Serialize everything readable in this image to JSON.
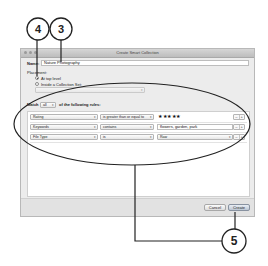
{
  "window": {
    "title": "Create Smart Collection"
  },
  "form": {
    "name_label": "Name:",
    "name_value": "Nature Photography",
    "placement_label": "Placement:",
    "radio_top_level": "At top level",
    "radio_top_level_checked": true,
    "radio_collection_set": "Inside a Collection Set:",
    "collection_set_value": ""
  },
  "rules": {
    "match_prefix": "Match",
    "match_value": "all",
    "match_suffix": "of the following rules:",
    "rows": [
      {
        "field": "Rating",
        "operator": "is greater than or equal to",
        "value": "★★★★★",
        "value_type": "stars"
      },
      {
        "field": "Keywords",
        "operator": "contains",
        "value": "flowers, garden, park",
        "value_type": "text"
      },
      {
        "field": "File Type",
        "operator": "is",
        "value": "Raw",
        "value_type": "popup"
      }
    ],
    "remove_label": "–",
    "add_label": "+"
  },
  "buttons": {
    "cancel": "Cancel",
    "create": "Create"
  },
  "callouts": [
    {
      "number": "4",
      "target": "radio-top-level"
    },
    {
      "number": "3",
      "target": "name-field"
    },
    {
      "number": "5",
      "target": "rules-and-create"
    }
  ],
  "colors": {
    "callout_stroke": "#222222",
    "window_bg": "#ececec"
  }
}
